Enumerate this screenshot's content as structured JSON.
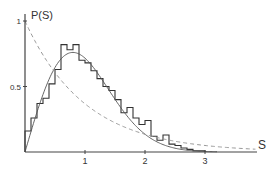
{
  "chart_data": {
    "type": "line",
    "title": "",
    "xlabel": "S",
    "ylabel": "P(S)",
    "xlim": [
      0,
      3.85
    ],
    "ylim": [
      0,
      1.0
    ],
    "x_ticks": [
      {
        "value": 1,
        "label": "1"
      },
      {
        "value": 2,
        "label": "2"
      },
      {
        "value": 3,
        "label": "3"
      }
    ],
    "y_ticks": [
      {
        "value": 0.5,
        "label": "0.5"
      },
      {
        "value": 1,
        "label": "1"
      }
    ],
    "grid": false,
    "legend": null,
    "series": [
      {
        "name": "histogram",
        "style": "step",
        "color": "#333333",
        "bin_edges": [
          0.0,
          0.1,
          0.2,
          0.3,
          0.4,
          0.5,
          0.6,
          0.7,
          0.8,
          0.9,
          1.0,
          1.1,
          1.2,
          1.3,
          1.4,
          1.5,
          1.6,
          1.7,
          1.8,
          1.9,
          2.0,
          2.1,
          2.2,
          2.3,
          2.4,
          2.5,
          2.6,
          2.7,
          2.8,
          2.9,
          3.0
        ],
        "values": [
          0.16,
          0.26,
          0.37,
          0.41,
          0.52,
          0.63,
          0.82,
          0.78,
          0.82,
          0.7,
          0.68,
          0.62,
          0.56,
          0.5,
          0.47,
          0.4,
          0.3,
          0.34,
          0.26,
          0.21,
          0.24,
          0.12,
          0.09,
          0.13,
          0.06,
          0.05,
          0.03,
          0.02,
          0.01,
          0.01
        ]
      },
      {
        "name": "Wigner surmise",
        "style": "solid",
        "color": "#555555",
        "formula": "(pi/2) s exp(-pi s^2 / 4)",
        "x": [
          0,
          0.2,
          0.4,
          0.6,
          0.8,
          1.0,
          1.2,
          1.4,
          1.6,
          1.8,
          2.0,
          2.2,
          2.4,
          2.6,
          2.8,
          3.0,
          3.2
        ],
        "values": [
          0,
          0.31,
          0.55,
          0.71,
          0.76,
          0.72,
          0.61,
          0.47,
          0.34,
          0.22,
          0.14,
          0.08,
          0.04,
          0.02,
          0.01,
          0.0,
          0.0
        ]
      },
      {
        "name": "Poisson",
        "style": "dashed",
        "color": "#999999",
        "formula": "exp(-s)",
        "x": [
          0,
          0.5,
          1.0,
          1.5,
          2.0,
          2.5,
          3.0,
          3.5,
          3.85
        ],
        "values": [
          1.0,
          0.61,
          0.37,
          0.22,
          0.14,
          0.08,
          0.05,
          0.03,
          0.02
        ]
      }
    ]
  },
  "axes": {
    "x_label": "S",
    "y_label": "P(S)"
  }
}
